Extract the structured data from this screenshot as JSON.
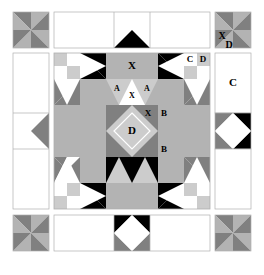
{
  "diagram": {
    "canvas": {
      "width": 264,
      "height": 275
    },
    "palette": {
      "background": "#ffffff",
      "white": "#ffffff",
      "light_gray": "#cccccc",
      "medium_gray": "#b3b3b3",
      "dark_gray": "#808080",
      "black": "#000000",
      "outline": "#b0b0b0",
      "label_dark": "#000000",
      "label_light": "#ffffff"
    },
    "labels": {
      "center_top_x": "X",
      "center_a_left": "A",
      "center_a_right": "A",
      "center_x_upper": "X",
      "center_x_mid": "X",
      "center_d": "D",
      "center_b_upper": "B",
      "center_b_lower": "B",
      "fourpatch_c": "C",
      "fourpatch_d": "D",
      "corner_x": "X",
      "corner_d": "D",
      "right_panel_c": "C"
    },
    "pieces": [
      {
        "code": "X",
        "name": "large-square-unit"
      },
      {
        "code": "A",
        "name": "small-triangle-unit"
      },
      {
        "code": "B",
        "name": "corner-triangle-unit"
      },
      {
        "code": "C",
        "name": "plain-white-square"
      },
      {
        "code": "D",
        "name": "center-diamond-square"
      }
    ],
    "panels": [
      {
        "name": "corner-pinwheel-top-left",
        "type": "pinwheel"
      },
      {
        "name": "border-top-center",
        "type": "flying-geese-white"
      },
      {
        "name": "corner-pinwheel-top-right",
        "type": "pinwheel",
        "labels": [
          "X",
          "D"
        ]
      },
      {
        "name": "border-middle-left",
        "type": "arrow-left"
      },
      {
        "name": "main-block",
        "type": "sampler-block"
      },
      {
        "name": "border-middle-right-top",
        "type": "plain-white",
        "labels": [
          "C"
        ]
      },
      {
        "name": "border-middle-right-bottom",
        "type": "diamond-in-square"
      },
      {
        "name": "corner-pinwheel-bottom-left",
        "type": "pinwheel"
      },
      {
        "name": "border-bottom-center",
        "type": "diamond-in-square"
      },
      {
        "name": "corner-pinwheel-bottom-right",
        "type": "pinwheel"
      }
    ]
  }
}
